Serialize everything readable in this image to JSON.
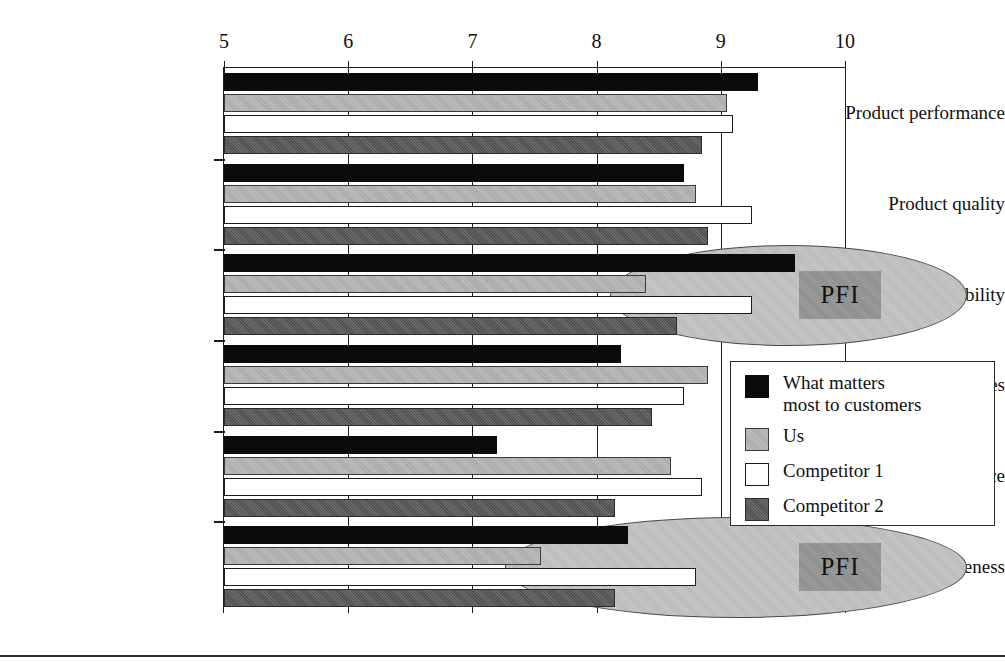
{
  "chart_data": {
    "type": "bar",
    "orientation": "horizontal",
    "title": "",
    "subtitle": "",
    "xlabel": "",
    "ylabel": "",
    "xlim": [
      5,
      10
    ],
    "xticks": [
      5,
      6,
      7,
      8,
      9,
      10
    ],
    "xtick_labels": [
      "5",
      "6",
      "7",
      "8",
      "9",
      "10"
    ],
    "grid": true,
    "grid_axis": "x",
    "legend_position": "center-right",
    "categories": [
      "Product performance",
      "Product quality",
      "Delivery reliability",
      "Lead times",
      "Technical service",
      "Responsiveness"
    ],
    "series": [
      {
        "name": "What matters most to customers",
        "color": "#0b0b0b",
        "values": [
          9.3,
          8.7,
          9.6,
          8.2,
          7.2,
          8.25
        ]
      },
      {
        "name": "Us",
        "color": "#a8a8a8",
        "values": [
          9.05,
          8.8,
          8.4,
          8.9,
          8.6,
          7.55
        ]
      },
      {
        "name": "Competitor 1",
        "color": "#ffffff",
        "values": [
          9.1,
          9.25,
          9.25,
          8.7,
          8.85,
          8.8
        ]
      },
      {
        "name": "Competitor 2",
        "color": "#4f4f4f",
        "values": [
          8.85,
          8.9,
          8.65,
          8.45,
          8.15,
          8.15
        ]
      }
    ],
    "annotations": [
      {
        "label": "PFI",
        "category": "Delivery reliability",
        "shape": "ellipse",
        "note": "Priority For Improvement highlight over the Delivery reliability group"
      },
      {
        "label": "PFI",
        "category": "Responsiveness",
        "shape": "ellipse",
        "note": "Priority For Improvement highlight over the Responsiveness group"
      }
    ]
  },
  "legend": {
    "entries": [
      {
        "label": "What matters\nmost to customers"
      },
      {
        "label": "Us"
      },
      {
        "label": "Competitor 1"
      },
      {
        "label": "Competitor 2"
      }
    ]
  },
  "colors": {
    "series_black": "#0b0b0b",
    "series_light_gray": "#a8a8a8",
    "series_white": "#ffffff",
    "series_dark_gray": "#4f4f4f",
    "ellipse_fill": "#b9b9b9",
    "pfi_box_fill": "#8c8c8c",
    "axis": "#1a1a1a",
    "background": "#ffffff"
  }
}
